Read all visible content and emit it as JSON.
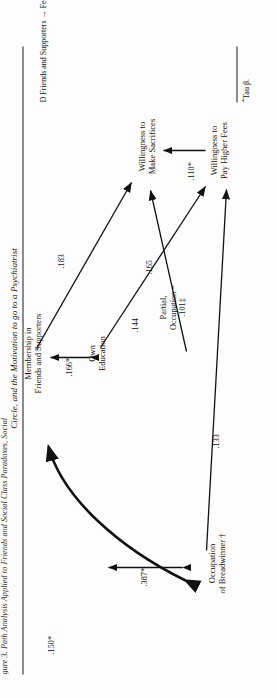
{
  "figure": {
    "cut_header": "gure 3. Path Analysis Applied to Friends and Social Class Paradoxes, Social",
    "title": "Circle, and the Motivation to go to a Psychiatrist",
    "nodes": [
      {
        "id": "occupation",
        "line1": "Occupation",
        "line2": "of Breadwinner †"
      },
      {
        "id": "education",
        "line1": "Own",
        "line2": "Education"
      },
      {
        "id": "membership",
        "line1": "Membership in",
        "line2": "Friends and Supporters"
      },
      {
        "id": "fees",
        "line1": "Willingness to",
        "line2": "Pay Higher Fees"
      },
      {
        "id": "sacrifices",
        "line1": "Willingness to",
        "line2": "Make Sacrifices"
      }
    ],
    "coefficients": [
      {
        "id": "occ-to-membership",
        "value": ".150*"
      },
      {
        "id": "occ-to-education",
        "value": ".387*"
      },
      {
        "id": "education-to-membership",
        "value": ".166*"
      },
      {
        "id": "education-to-sacrifices",
        "value": ".165"
      },
      {
        "id": "education-to-fees",
        "value": ".144"
      },
      {
        "id": "membership-to-sacrifices",
        "value": ".183"
      },
      {
        "id": "occ-to-fees",
        "value": ".133"
      },
      {
        "id": "fees-to-sacrifices",
        "value": ".110*"
      },
      {
        "id": "partial-occupation-line1",
        "value": "Partial,"
      },
      {
        "id": "partial-occupation-line2",
        "value": "Occupation ="
      },
      {
        "id": "partial-occupation-line3",
        "value": ".101‡"
      }
    ],
    "footnotes": [
      {
        "id": "note-d",
        "text": "D  Friends and Supporters → Fees = .08 (0.25‡ with Occupation Controlled)."
      },
      {
        "id": "note-tau",
        "marker": "*",
        "text": "Tau β."
      }
    ]
  }
}
